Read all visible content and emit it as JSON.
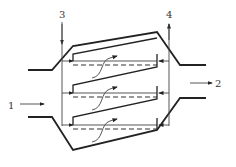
{
  "diagram": {
    "type": "schematic",
    "labels": {
      "inlet": "1",
      "outlet": "2",
      "channel_left": "3",
      "channel_right": "4"
    },
    "stages": [
      {
        "name": "stage-1"
      },
      {
        "name": "stage-2"
      },
      {
        "name": "stage-3"
      }
    ],
    "colors": {
      "line": "#222222",
      "background": "#ffffff"
    }
  }
}
